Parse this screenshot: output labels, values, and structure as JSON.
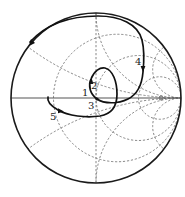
{
  "diagram": {
    "type": "smith-chart",
    "colors": {
      "curve": "#111111",
      "grid": "#6a6a6a",
      "outer": "#1a1a1a"
    },
    "resistance_circles": [
      "1/3",
      "1",
      "3"
    ],
    "reactance_arcs": [
      "±1/3",
      "±1",
      "±3"
    ],
    "points": [
      {
        "id": "1",
        "label": "1"
      },
      {
        "id": "2",
        "label": "2"
      },
      {
        "id": "3",
        "label": "3"
      },
      {
        "id": "4",
        "label": "4"
      },
      {
        "id": "5",
        "label": "5"
      }
    ]
  }
}
